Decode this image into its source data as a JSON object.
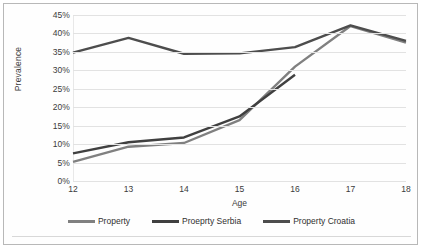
{
  "chart_data": {
    "type": "line",
    "title": "",
    "xlabel": "Age",
    "ylabel": "Prevalence",
    "categories": [
      12,
      13,
      14,
      15,
      16,
      17,
      18
    ],
    "x_tick_labels": [
      "12",
      "13",
      "14",
      "15",
      "16",
      "17",
      "18"
    ],
    "y_tick_labels": [
      "0%",
      "5%",
      "10%",
      "15%",
      "20%",
      "25%",
      "30%",
      "35%",
      "40%",
      "45%"
    ],
    "y_tick_values": [
      0,
      5,
      10,
      15,
      20,
      25,
      30,
      35,
      40,
      45
    ],
    "ylim": [
      0,
      45
    ],
    "xlim": [
      12,
      18
    ],
    "grid": "horizontal",
    "legend_position": "bottom",
    "series": [
      {
        "name": "Property",
        "color": "#808080",
        "values": [
          5.2,
          9.3,
          10.3,
          16.5,
          31.0,
          42.0,
          37.5
        ]
      },
      {
        "name": "Proeprty Serbia",
        "color": "#404040",
        "values": [
          7.5,
          10.5,
          11.8,
          17.5,
          28.8,
          null,
          null
        ]
      },
      {
        "name": "Property Croatia",
        "color": "#4d4d4d",
        "values": [
          34.8,
          38.8,
          34.5,
          34.6,
          36.3,
          42.2,
          38.0
        ]
      }
    ]
  },
  "axes": {
    "y_title": "Prevalence",
    "x_title": "Age"
  },
  "legend": {
    "items": [
      {
        "label": "Property"
      },
      {
        "label": "Proeprty Serbia"
      },
      {
        "label": "Property Croatia"
      }
    ]
  },
  "colors": {
    "series_1": "#808080",
    "series_2": "#404040",
    "series_3": "#4d4d4d",
    "gridline": "#e2e2e2",
    "border": "#b8b8b8",
    "text": "#3b3b3b",
    "background": "#ffffff"
  }
}
